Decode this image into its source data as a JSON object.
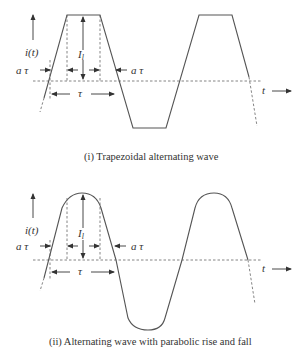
{
  "figure": {
    "panel1": {
      "caption": "(i) Trapezoidal alternating wave",
      "y_label": "i(t)",
      "x_label": "t",
      "amplitude_label": "I",
      "amplitude_subscript": "l",
      "rise_label_left": "a τ",
      "rise_label_right": "a τ",
      "period_label": "τ"
    },
    "panel2": {
      "caption": "(ii) Alternating wave with parabolic rise and fall",
      "y_label": "i(t)",
      "x_label": "t",
      "amplitude_label": "I",
      "amplitude_subscript": "l",
      "rise_label_left": "a τ",
      "rise_label_right": "a τ",
      "period_label": "τ"
    }
  }
}
